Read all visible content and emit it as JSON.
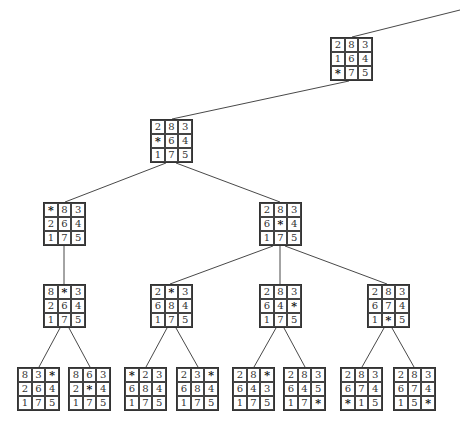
{
  "diagram": {
    "type": "search-tree",
    "blank_symbol": "*",
    "nodes": [
      {
        "id": "n0",
        "x": 330,
        "y": 37,
        "cells": [
          "2",
          "8",
          "3",
          "1",
          "6",
          "4",
          "*",
          "7",
          "5"
        ]
      },
      {
        "id": "n1",
        "x": 150,
        "y": 119,
        "cells": [
          "2",
          "8",
          "3",
          "*",
          "6",
          "4",
          "1",
          "7",
          "5"
        ]
      },
      {
        "id": "n2",
        "x": 43,
        "y": 202,
        "cells": [
          "*",
          "8",
          "3",
          "2",
          "6",
          "4",
          "1",
          "7",
          "5"
        ]
      },
      {
        "id": "n3",
        "x": 259,
        "y": 202,
        "cells": [
          "2",
          "8",
          "3",
          "6",
          "*",
          "4",
          "1",
          "7",
          "5"
        ]
      },
      {
        "id": "n4",
        "x": 43,
        "y": 284,
        "cells": [
          "8",
          "*",
          "3",
          "2",
          "6",
          "4",
          "1",
          "7",
          "5"
        ]
      },
      {
        "id": "n5",
        "x": 150,
        "y": 284,
        "cells": [
          "2",
          "*",
          "3",
          "6",
          "8",
          "4",
          "1",
          "7",
          "5"
        ]
      },
      {
        "id": "n6",
        "x": 259,
        "y": 284,
        "cells": [
          "2",
          "8",
          "3",
          "6",
          "4",
          "*",
          "1",
          "7",
          "5"
        ]
      },
      {
        "id": "n7",
        "x": 367,
        "y": 284,
        "cells": [
          "2",
          "8",
          "3",
          "6",
          "7",
          "4",
          "1",
          "*",
          "5"
        ]
      },
      {
        "id": "n8",
        "x": 17,
        "y": 367,
        "cells": [
          "8",
          "3",
          "*",
          "2",
          "6",
          "4",
          "1",
          "7",
          "5"
        ]
      },
      {
        "id": "n9",
        "x": 68,
        "y": 367,
        "cells": [
          "8",
          "6",
          "3",
          "2",
          "*",
          "4",
          "1",
          "7",
          "5"
        ]
      },
      {
        "id": "n10",
        "x": 124,
        "y": 367,
        "cells": [
          "*",
          "2",
          "3",
          "6",
          "8",
          "4",
          "1",
          "7",
          "5"
        ]
      },
      {
        "id": "n11",
        "x": 176,
        "y": 367,
        "cells": [
          "2",
          "3",
          "*",
          "6",
          "8",
          "4",
          "1",
          "7",
          "5"
        ]
      },
      {
        "id": "n12",
        "x": 232,
        "y": 367,
        "cells": [
          "2",
          "8",
          "*",
          "6",
          "4",
          "3",
          "1",
          "7",
          "5"
        ]
      },
      {
        "id": "n13",
        "x": 283,
        "y": 367,
        "cells": [
          "2",
          "8",
          "3",
          "6",
          "4",
          "5",
          "1",
          "7",
          "*"
        ]
      },
      {
        "id": "n14",
        "x": 340,
        "y": 367,
        "cells": [
          "2",
          "8",
          "3",
          "6",
          "7",
          "4",
          "*",
          "1",
          "5"
        ]
      },
      {
        "id": "n15",
        "x": 393,
        "y": 367,
        "cells": [
          "2",
          "8",
          "3",
          "6",
          "7",
          "4",
          "1",
          "5",
          "*"
        ]
      }
    ],
    "edges": [
      {
        "x1": 460,
        "y1": 10,
        "x2": 352,
        "y2": 37
      },
      {
        "x1": 349,
        "y1": 81,
        "x2": 172,
        "y2": 119
      },
      {
        "x1": 166,
        "y1": 163,
        "x2": 65,
        "y2": 202
      },
      {
        "x1": 176,
        "y1": 163,
        "x2": 280,
        "y2": 202
      },
      {
        "x1": 64,
        "y1": 246,
        "x2": 64,
        "y2": 284
      },
      {
        "x1": 273,
        "y1": 246,
        "x2": 170,
        "y2": 284
      },
      {
        "x1": 280,
        "y1": 246,
        "x2": 280,
        "y2": 284
      },
      {
        "x1": 285,
        "y1": 246,
        "x2": 387,
        "y2": 284
      },
      {
        "x1": 60,
        "y1": 328,
        "x2": 39,
        "y2": 367
      },
      {
        "x1": 69,
        "y1": 328,
        "x2": 90,
        "y2": 367
      },
      {
        "x1": 167,
        "y1": 328,
        "x2": 146,
        "y2": 367
      },
      {
        "x1": 176,
        "y1": 328,
        "x2": 198,
        "y2": 367
      },
      {
        "x1": 276,
        "y1": 328,
        "x2": 254,
        "y2": 367
      },
      {
        "x1": 284,
        "y1": 328,
        "x2": 305,
        "y2": 367
      },
      {
        "x1": 384,
        "y1": 328,
        "x2": 362,
        "y2": 367
      },
      {
        "x1": 392,
        "y1": 328,
        "x2": 414,
        "y2": 367
      }
    ],
    "colors": {
      "line": "#333333",
      "text": "#333333",
      "background": "#ffffff"
    }
  }
}
